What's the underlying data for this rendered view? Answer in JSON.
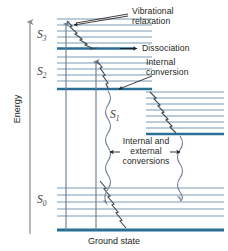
{
  "figure": {
    "type": "jablonski-energy-level-diagram",
    "title_axis": "Energy",
    "baseline_label": "Ground state",
    "colors": {
      "vibrational_line": "#7d99b4",
      "electronic_line": "#2b6f96",
      "axis": "#8a8a8a",
      "transition_arrow": "#6f7f93",
      "text": "#231f20",
      "state_label": "#3a3a3a",
      "background": "#ffffff"
    }
  },
  "axis": {
    "label": "Energy",
    "direction": "up",
    "arrowhead": true,
    "x": 30,
    "y_top": 20,
    "y_bottom": 234
  },
  "state_labels": [
    {
      "name": "S3",
      "base": "S",
      "sub": "3",
      "x": 40,
      "y": 33
    },
    {
      "name": "S2",
      "base": "S",
      "sub": "2",
      "x": 40,
      "y": 70
    },
    {
      "name": "S1",
      "base": "S",
      "sub": "1",
      "x": 112,
      "y": 113
    },
    {
      "name": "S0",
      "base": "S",
      "sub": "0",
      "x": 40,
      "y": 198
    }
  ],
  "annotations": [
    {
      "name": "vibrational-relaxation",
      "line1": "Vibrational",
      "line2": "relaxation",
      "x": 128,
      "y": 11
    },
    {
      "name": "dissociation",
      "line1": "Dissociation",
      "line2": "",
      "x": 140,
      "y": 48
    },
    {
      "name": "internal-conversion",
      "line1": "Internal",
      "line2": "conversion",
      "x": 140,
      "y": 68
    },
    {
      "name": "internal-external-conversions",
      "line1": "Internal and",
      "line2": "external",
      "line3": "conversions",
      "x": 121,
      "y": 142
    }
  ],
  "levels": {
    "left_manifold_x0": 57,
    "left_manifold_x1": 150,
    "right_manifold_x0": 143,
    "right_manifold_x1": 224,
    "S3_vibrational_y": [
      19,
      25,
      31,
      37,
      43
    ],
    "S3_electronic_y": 48,
    "S2_vibrational_y": [
      57,
      63,
      69,
      75,
      81
    ],
    "S2_electronic_y": 88,
    "S1_vibrational_y": [
      94,
      100,
      106,
      112,
      118,
      124
    ],
    "S1_electronic_y": 131,
    "S0_vibrational_y": [
      188,
      195,
      202,
      209,
      216
    ],
    "S0_ground_y": 230
  },
  "transitions": [
    {
      "name": "absorption-to-S3",
      "type": "straight-arrow-up",
      "x": 66,
      "y_from": 230,
      "y_to": 21
    },
    {
      "name": "absorption-to-S2",
      "type": "straight-arrow-up",
      "x": 96,
      "y_from": 230,
      "y_to": 59
    },
    {
      "name": "vibrational-relaxation-S3",
      "type": "zigzag-down",
      "from": [
        66,
        21
      ],
      "to": [
        112,
        48
      ]
    },
    {
      "name": "vibrational-relaxation-S1-right",
      "type": "zigzag-down",
      "from": [
        148,
        92
      ],
      "to": [
        196,
        131
      ]
    },
    {
      "name": "internal-conversion-S2-to-S0",
      "type": "zigzag-down",
      "from": [
        96,
        60
      ],
      "to": [
        150,
        230
      ]
    },
    {
      "name": "wavy-conversion-left",
      "type": "wavy-vertical",
      "x": 106,
      "y_from": 90,
      "y_to": 195
    },
    {
      "name": "wavy-conversion-right",
      "type": "wavy-vertical",
      "x": 196,
      "y_from": 133,
      "y_to": 196
    }
  ],
  "pointers": [
    {
      "name": "pointer-vibrational-relaxation",
      "from": [
        126,
        14
      ],
      "to": [
        72,
        24
      ]
    },
    {
      "name": "pointer-dissociation",
      "from": [
        137,
        48
      ],
      "to": [
        112,
        48
      ]
    },
    {
      "name": "pointer-internal-conversion",
      "from": [
        150,
        76
      ],
      "to": [
        116,
        90
      ]
    },
    {
      "name": "pointer-conv-left",
      "from": [
        118,
        152
      ],
      "to": [
        108,
        152
      ]
    },
    {
      "name": "pointer-conv-right",
      "from": [
        183,
        152
      ],
      "to": [
        194,
        152
      ]
    }
  ]
}
